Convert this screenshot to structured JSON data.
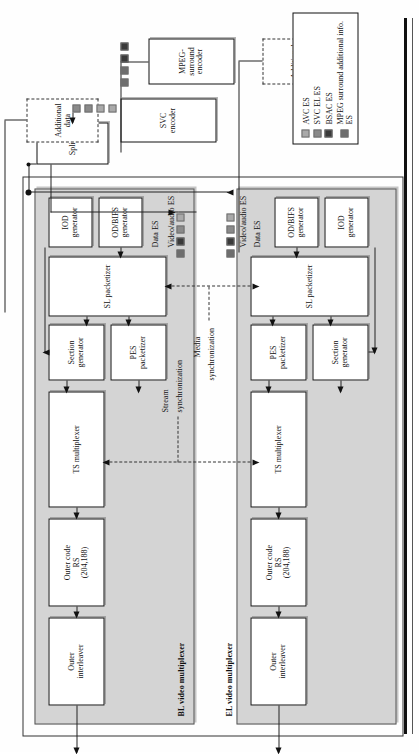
{
  "figure": {
    "orientation": "rotated-90-ccw"
  },
  "bl_multiplexer": {
    "label": "BL video multiplexer",
    "blocks": {
      "outer_interleaver": "Outer\ninterleaver",
      "outer_code": "Outer code\nRS\n(204,188)",
      "ts_multiplexer": "TS multiplexer",
      "section_generator": "Section\ngenerator",
      "pes_packetizer": "PES\npacketizer",
      "sl_packetizer": "SL packetizer",
      "iod_generator": "IOD\ngenerator",
      "od_bifs_generator": "OD/BIFS\ngenerator"
    },
    "stream_labels": {
      "data_es": "Data ES",
      "video_audio_es": "Video/audio ES"
    }
  },
  "el_multiplexer": {
    "label": "EL video multiplexer",
    "blocks": {
      "outer_interleaver": "Outer\ninterleaver",
      "outer_code": "Outer code\nRS\n(204,188)",
      "ts_multiplexer": "TS multiplexer",
      "section_generator": "Section\ngenerator",
      "pes_packetizer": "PES\npacketizer",
      "sl_packetizer": "SL packetizer",
      "iod_generator": "IOD\ngenerator",
      "od_bifs_generator": "OD/BIFS\ngenerator"
    },
    "stream_labels": {
      "data_es": "Data ES",
      "video_audio_es": "Video/audio ES"
    }
  },
  "sync": {
    "stream": "Stream\nsynchronization",
    "media": "Media\nsynchronization"
  },
  "sources": {
    "svc_encoder": "SVC encoder",
    "splitter": "Splitter",
    "mpeg_surround_encoder": "MPEG-\nsurround\nencoder",
    "additional_data_left": "Additional data",
    "additional_data_right": "Additional data"
  },
  "legend": {
    "items": [
      {
        "label": "AVC ES",
        "color": "#a9a9a9",
        "swatch": "sw-avc"
      },
      {
        "label": "SVC EL ES",
        "color": "#8a8a8a",
        "swatch": "sw-svcel"
      },
      {
        "label": "BSAC ES",
        "color": "#3a3a3a",
        "swatch": "sw-bsac"
      },
      {
        "label": "MPEG surround additional info. ES",
        "color": "#6e6e6e",
        "swatch": "sw-mps"
      }
    ]
  },
  "colors": {
    "panel_fill": "#d4d4d4",
    "box_fill": "#ffffff",
    "line": "#111111"
  }
}
